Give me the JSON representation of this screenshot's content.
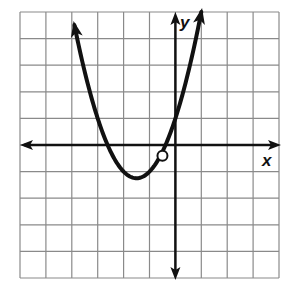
{
  "chart_data": {
    "type": "line",
    "title": "",
    "xlabel": "x",
    "ylabel": "y",
    "xlim": [
      -6,
      4
    ],
    "ylim": [
      -5,
      5
    ],
    "grid": true,
    "grid_step": 1,
    "axes_arrows": true,
    "series": [
      {
        "name": "parabola",
        "function": "y = x^2 + 3x + 1",
        "x": [
          -3.9,
          -3.5,
          -3,
          -2.62,
          -2.5,
          -2,
          -1.5,
          -1,
          -0.5,
          -0.38,
          0,
          0.5,
          1.0
        ],
        "y": [
          4.51,
          2.75,
          1,
          0,
          -0.25,
          -1,
          -1.25,
          -1,
          -0.25,
          0,
          1,
          2.75,
          5.0
        ],
        "vertex": [
          -1.5,
          -1.25
        ],
        "x_intercepts": [
          -2.62,
          -0.38
        ],
        "y_intercept": 1,
        "end_arrows": true,
        "open_circle": [
          -0.5,
          -0.4
        ]
      }
    ]
  },
  "labels": {
    "x_axis": "x",
    "y_axis": "y"
  },
  "colors": {
    "grid": "#8a8a8a",
    "curve": "#111111",
    "axes": "#111111"
  }
}
